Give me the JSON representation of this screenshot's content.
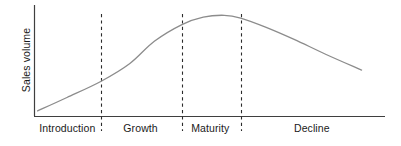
{
  "chart_data": {
    "type": "line",
    "title": "",
    "subtitle": "",
    "xlabel": "",
    "ylabel": "Sales volume",
    "grid": false,
    "legend": false,
    "legend_position": "none",
    "axis_tick_labels": [],
    "xlim": [
      0,
      100
    ],
    "ylim": [
      0,
      100
    ],
    "annotations": [
      "Introduction",
      "Growth",
      "Maturity",
      "Decline"
    ],
    "stages": [
      {
        "label": "Introduction",
        "x_start": 0,
        "x_end": 18.8
      },
      {
        "label": "Growth",
        "x_start": 18.8,
        "x_end": 41.9
      },
      {
        "label": "Maturity",
        "x_start": 41.9,
        "x_end": 58.7
      },
      {
        "label": "Decline",
        "x_start": 58.7,
        "x_end": 100
      }
    ],
    "dividers_x": [
      18.8,
      41.9,
      58.7
    ],
    "series": [
      {
        "name": "Sales volume",
        "x": [
          0.6,
          9,
          18.8,
          27,
          34,
          41.9,
          48,
          54,
          58.7,
          66,
          74,
          83,
          93.3
        ],
        "values": [
          4.5,
          17.5,
          33.3,
          50.5,
          72.1,
          88.3,
          95.5,
          97.3,
          94.6,
          85.6,
          73.9,
          59.5,
          44.1
        ]
      }
    ],
    "colors": {
      "curve": "#8c8c8c",
      "axis": "#3f3f3f",
      "divider": "#2b2b2b",
      "text": "#1a1a1a",
      "background": "#ffffff"
    }
  },
  "axes": {
    "y_label": "Sales volume"
  },
  "stage_labels": [
    "Introduction",
    "Growth",
    "Maturity",
    "Decline"
  ]
}
